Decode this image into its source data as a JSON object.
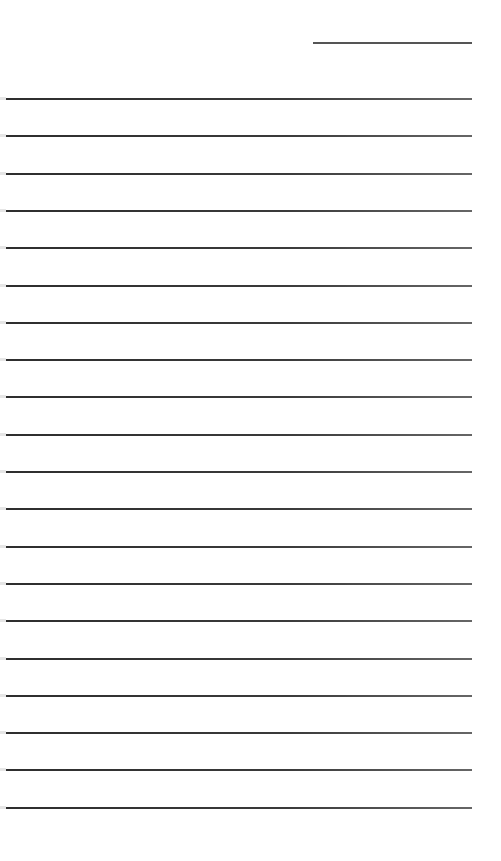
{
  "document": {
    "type": "lined-paper",
    "header_line": {
      "x": 313,
      "y": 42,
      "width": 159,
      "color": "#555555"
    },
    "ruled_lines": {
      "count": 20,
      "start_y": 98,
      "spacing": 37.3,
      "x": 6,
      "width": 466,
      "color": "#333333"
    },
    "background": "#ffffff"
  }
}
